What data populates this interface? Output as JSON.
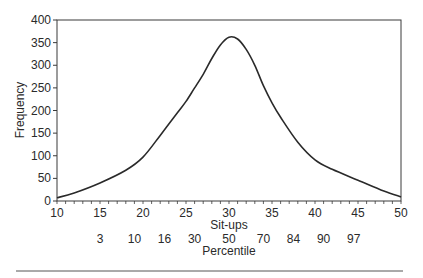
{
  "chart_data": {
    "type": "line",
    "title": "",
    "xlabel": "Sit-ups",
    "ylabel": "Frequency",
    "secondary_xlabel": "Percentile",
    "xlim": [
      10,
      50
    ],
    "ylim": [
      0,
      400
    ],
    "grid": false,
    "legend": null,
    "x_ticks": [
      10,
      15,
      20,
      25,
      30,
      35,
      40,
      45,
      50
    ],
    "y_ticks": [
      0,
      50,
      100,
      150,
      200,
      250,
      300,
      350,
      400
    ],
    "percentile_ticks": [
      {
        "label": "3",
        "x": 15
      },
      {
        "label": "10",
        "x": 19
      },
      {
        "label": "16",
        "x": 22.5
      },
      {
        "label": "30",
        "x": 26
      },
      {
        "label": "50",
        "x": 30
      },
      {
        "label": "70",
        "x": 34
      },
      {
        "label": "84",
        "x": 37.5
      },
      {
        "label": "90",
        "x": 41
      },
      {
        "label": "97",
        "x": 44.5
      }
    ],
    "series": [
      {
        "name": "Sit-ups distribution",
        "x": [
          10,
          12,
          15,
          18,
          20,
          22,
          24,
          25,
          26,
          27,
          28,
          29,
          30,
          31,
          32,
          33,
          34,
          35,
          36,
          38,
          40,
          42,
          45,
          48,
          50
        ],
        "values": [
          7,
          18,
          40,
          68,
          97,
          145,
          195,
          220,
          250,
          280,
          315,
          345,
          362,
          358,
          335,
          300,
          255,
          217,
          185,
          130,
          91,
          70,
          46,
          22,
          9
        ]
      }
    ]
  }
}
